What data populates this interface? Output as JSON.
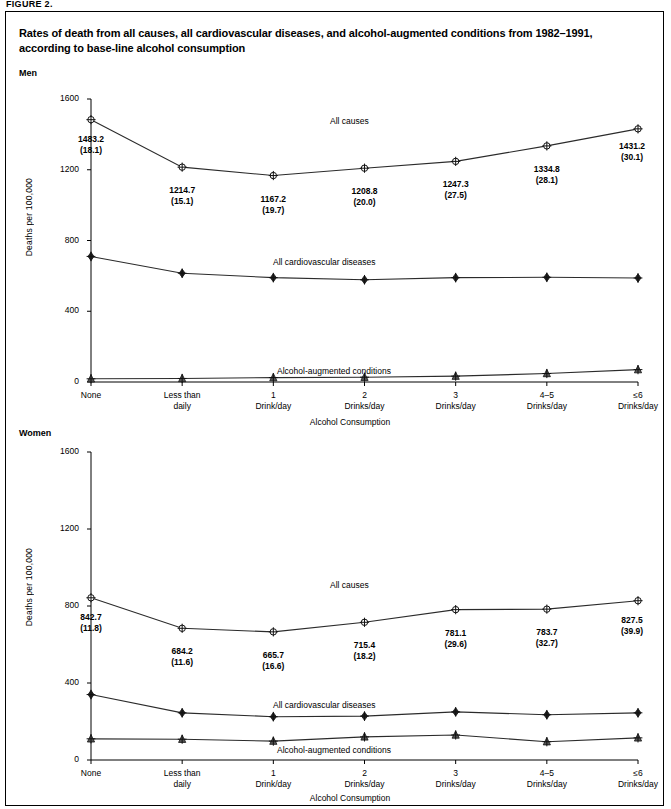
{
  "figure_label": "FIGURE 2.",
  "title": "Rates of death from all causes, all cardiovascular diseases, and alcohol-augmented conditions from 1982–1991, according to base-line alcohol consumption",
  "panels": {
    "men": {
      "label": "Men"
    },
    "women": {
      "label": "Women"
    }
  },
  "axis": {
    "ylabel": "Deaths per 100,000",
    "xlabel": "Alcohol Consumption",
    "yticks": [
      "0",
      "400",
      "800",
      "1200",
      "1600"
    ],
    "xticks": [
      {
        "line1": "None",
        "line2": ""
      },
      {
        "line1": "Less than",
        "line2": "daily"
      },
      {
        "line1": "1",
        "line2": "Drink/day"
      },
      {
        "line1": "2",
        "line2": "Drinks/day"
      },
      {
        "line1": "3",
        "line2": "Drinks/day"
      },
      {
        "line1": "4–5",
        "line2": "Drinks/day"
      },
      {
        "line1": "≤6",
        "line2": "Drinks/day"
      }
    ]
  },
  "series_names": {
    "all_causes": "All causes",
    "cardiovascular": "All cardiovascular diseases",
    "alcohol": "Alcohol-augmented conditions"
  },
  "chart_data": [
    {
      "type": "line",
      "title": "Men",
      "xlabel": "Alcohol Consumption",
      "ylabel": "Deaths per 100,000",
      "ylim": [
        0,
        1600
      ],
      "grid": false,
      "legend": "inline-labels",
      "categories": [
        "None",
        "Less than daily",
        "1 Drink/day",
        "2 Drinks/day",
        "3 Drinks/day",
        "4–5 Drinks/day",
        "≤6 Drinks/day"
      ],
      "series": [
        {
          "name": "All causes",
          "marker": "open-circle-cross",
          "values": [
            1483.2,
            1214.7,
            1167.2,
            1208.8,
            1247.3,
            1334.8,
            1431.2
          ],
          "standard_errors": [
            18.1,
            15.1,
            19.7,
            20.0,
            27.5,
            28.1,
            30.1
          ],
          "point_labels": [
            {
              "value": "1483.2",
              "se": "(18.1)"
            },
            {
              "value": "1214.7",
              "se": "(15.1)"
            },
            {
              "value": "1167.2",
              "se": "(19.7)"
            },
            {
              "value": "1208.8",
              "se": "(20.0)"
            },
            {
              "value": "1247.3",
              "se": "(27.5)"
            },
            {
              "value": "1334.8",
              "se": "(28.1)"
            },
            {
              "value": "1431.2",
              "se": "(30.1)"
            }
          ]
        },
        {
          "name": "All cardiovascular diseases",
          "marker": "filled-diamond",
          "values": [
            710,
            615,
            590,
            578,
            590,
            592,
            588
          ],
          "point_labels": []
        },
        {
          "name": "Alcohol-augmented conditions",
          "marker": "triangle",
          "values": [
            18,
            20,
            25,
            27,
            33,
            48,
            70
          ],
          "point_labels": []
        }
      ]
    },
    {
      "type": "line",
      "title": "Women",
      "xlabel": "Alcohol Consumption",
      "ylabel": "Deaths per 100,000",
      "ylim": [
        0,
        1600
      ],
      "grid": false,
      "legend": "inline-labels",
      "categories": [
        "None",
        "Less than daily",
        "1 Drink/day",
        "2 Drinks/day",
        "3 Drinks/day",
        "4–5 Drinks/day",
        "≤6 Drinks/day"
      ],
      "series": [
        {
          "name": "All causes",
          "marker": "open-circle-cross",
          "values": [
            842.7,
            684.2,
            665.7,
            715.4,
            781.1,
            783.7,
            827.5
          ],
          "standard_errors": [
            11.8,
            11.6,
            16.6,
            18.2,
            29.6,
            32.7,
            39.9
          ],
          "point_labels": [
            {
              "value": "842.7",
              "se": "(11.8)"
            },
            {
              "value": "684.2",
              "se": "(11.6)"
            },
            {
              "value": "665.7",
              "se": "(16.6)"
            },
            {
              "value": "715.4",
              "se": "(18.2)"
            },
            {
              "value": "781.1",
              "se": "(29.6)"
            },
            {
              "value": "783.7",
              "se": "(32.7)"
            },
            {
              "value": "827.5",
              "se": "(39.9)"
            }
          ]
        },
        {
          "name": "All cardiovascular diseases",
          "marker": "filled-diamond",
          "values": [
            340,
            245,
            225,
            228,
            250,
            235,
            245
          ],
          "point_labels": []
        },
        {
          "name": "Alcohol-augmented conditions",
          "marker": "triangle",
          "values": [
            110,
            108,
            98,
            120,
            130,
            95,
            115
          ],
          "point_labels": []
        }
      ]
    }
  ]
}
